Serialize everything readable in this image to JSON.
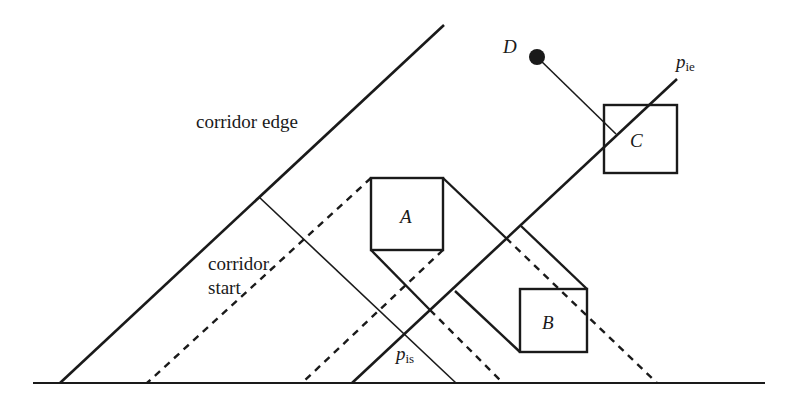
{
  "diagram": {
    "title": "",
    "colors": {
      "stroke": "#1a1a1a",
      "background": "#ffffff"
    },
    "labels": {
      "corridor_edge": "corridor edge",
      "corridor_start_line1": "corridor",
      "corridor_start_line2": "start",
      "box_a": "A",
      "box_b": "B",
      "box_c": "C",
      "point_d": "D",
      "p_ie_main": "p",
      "p_ie_sub": "ie",
      "p_is_main": "p",
      "p_is_sub": "is"
    },
    "baseline": {
      "x1": 33,
      "y1": 383,
      "x2": 765,
      "y2": 383
    },
    "boxes": [
      {
        "id": "A",
        "x": 371,
        "y": 178,
        "w": 72,
        "h": 72
      },
      {
        "id": "B",
        "x": 520,
        "y": 289,
        "w": 67,
        "h": 63
      },
      {
        "id": "C",
        "x": 604,
        "y": 105,
        "w": 73,
        "h": 68
      }
    ],
    "point_d": {
      "cx": 537,
      "cy": 57,
      "r": 8
    },
    "solid_lines": [
      {
        "name": "corridor-edge-line",
        "x1": 60,
        "y1": 383,
        "x2": 444,
        "y2": 25,
        "w": 2.6
      },
      {
        "name": "corridor-start-line",
        "x1": 259,
        "y1": 197,
        "x2": 456,
        "y2": 383,
        "w": 1.6
      },
      {
        "name": "p-ie-path-line",
        "x1": 352,
        "y1": 383,
        "x2": 677,
        "y2": 79,
        "w": 2.6
      },
      {
        "name": "a-top-right-sweep",
        "x1": 443,
        "y1": 178,
        "x2": 506,
        "y2": 238,
        "w": 2.4
      },
      {
        "name": "a-bottom-left-sweep",
        "x1": 371,
        "y1": 250,
        "x2": 430,
        "y2": 310,
        "w": 2.4
      },
      {
        "name": "b-top-right-sweep",
        "x1": 521,
        "y1": 226,
        "x2": 587,
        "y2": 289,
        "w": 2.4
      },
      {
        "name": "b-bottom-left-sweep",
        "x1": 455,
        "y1": 291,
        "x2": 520,
        "y2": 352,
        "w": 2.4
      },
      {
        "name": "d-to-c-line",
        "x1": 537,
        "y1": 57,
        "x2": 616,
        "y2": 134,
        "w": 1.6
      }
    ],
    "dashed_lines": [
      {
        "name": "a-top-left-dashed",
        "x1": 371,
        "y1": 178,
        "x2": 147,
        "y2": 383
      },
      {
        "name": "a-bottom-right-dashed",
        "x1": 443,
        "y1": 250,
        "x2": 302,
        "y2": 383
      },
      {
        "name": "a-lower-dashed-right",
        "x1": 430,
        "y1": 310,
        "x2": 503,
        "y2": 383
      },
      {
        "name": "b-upper-dashed-right",
        "x1": 506,
        "y1": 238,
        "x2": 657,
        "y2": 383
      }
    ]
  }
}
